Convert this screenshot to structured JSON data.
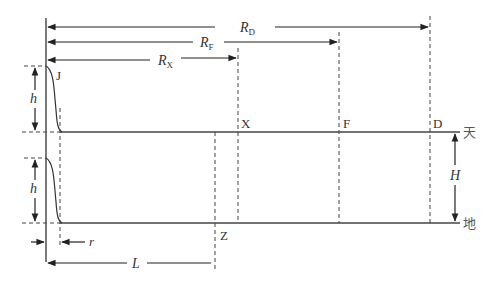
{
  "distances": {
    "rd": {
      "main": "R",
      "sub": "D"
    },
    "rf": {
      "main": "R",
      "sub": "F"
    },
    "rx": {
      "main": "R",
      "sub": "X"
    },
    "l": "L",
    "r": "r"
  },
  "heights": {
    "h_top": "h",
    "h_bottom": "h",
    "H": "H"
  },
  "points": {
    "j": "J",
    "x": "X",
    "f": "F",
    "d": "D",
    "z": "Z"
  },
  "levels": {
    "sky": "天",
    "ground": "地"
  },
  "colors": {
    "line": "#333333",
    "dash": "#444444"
  }
}
